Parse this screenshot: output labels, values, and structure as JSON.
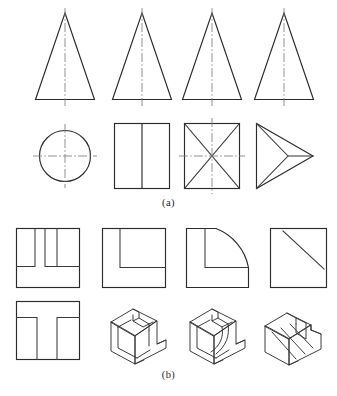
{
  "figure": {
    "background_color": "#ffffff",
    "line_color": "#2b2b2b",
    "centerline_color": "#7d7d7d",
    "width": 337,
    "height": 396
  },
  "captions": {
    "part_a": "(a)",
    "part_b": "(b)"
  },
  "part_a": {
    "label": "(a)",
    "row_top": {
      "name": "front-views-row",
      "description": "Four identical isosceles triangle front views with vertical centre lines",
      "items": [
        {
          "name": "triangle-front-view-1",
          "shape": "isosceles-triangle",
          "centerline": "vertical"
        },
        {
          "name": "triangle-front-view-2",
          "shape": "isosceles-triangle",
          "centerline": "vertical"
        },
        {
          "name": "triangle-front-view-3",
          "shape": "isosceles-triangle",
          "centerline": "vertical"
        },
        {
          "name": "triangle-front-view-4",
          "shape": "isosceles-triangle",
          "centerline": "vertical"
        }
      ]
    },
    "row_bottom": {
      "name": "top-views-row",
      "description": "Four alternative top views beneath the triangles",
      "items": [
        {
          "name": "circle-top-view",
          "shape": "circle-with-cross-centerlines"
        },
        {
          "name": "rectangle-top-view",
          "shape": "rectangle-with-vertical-division"
        },
        {
          "name": "square-diagonals-top-view",
          "shape": "square-with-diagonals-and-centerlines"
        },
        {
          "name": "arrowhead-top-view",
          "shape": "triangle-wedge-pointing-right"
        }
      ]
    }
  },
  "part_b": {
    "label": "(b)",
    "row_top": {
      "name": "top-views-row-b",
      "description": "Four square outlines with differing internal features",
      "items": [
        {
          "name": "double-slot-square-view",
          "shape": "square-with-two-vertical-slots"
        },
        {
          "name": "corner-step-square-view",
          "shape": "square-with-inner-L-step"
        },
        {
          "name": "quarter-round-square-view",
          "shape": "square-with-quarter-arc-corner-and-L-step"
        },
        {
          "name": "diagonal-square-view",
          "shape": "square-with-diagonal-line"
        }
      ]
    },
    "row_bottom": {
      "name": "front-view-and-isometrics-row",
      "description": "One front view followed by three isometric pictorial solids",
      "items": [
        {
          "name": "inverted-t-front-view",
          "shape": "square-with-two-bottom-slots"
        },
        {
          "name": "isometric-solid-1",
          "shape": "isometric-block-with-rectangular-slot"
        },
        {
          "name": "isometric-solid-2",
          "shape": "isometric-block-with-curved-slot"
        },
        {
          "name": "isometric-solid-3",
          "shape": "isometric-block-with-inclined-slot"
        }
      ]
    }
  }
}
